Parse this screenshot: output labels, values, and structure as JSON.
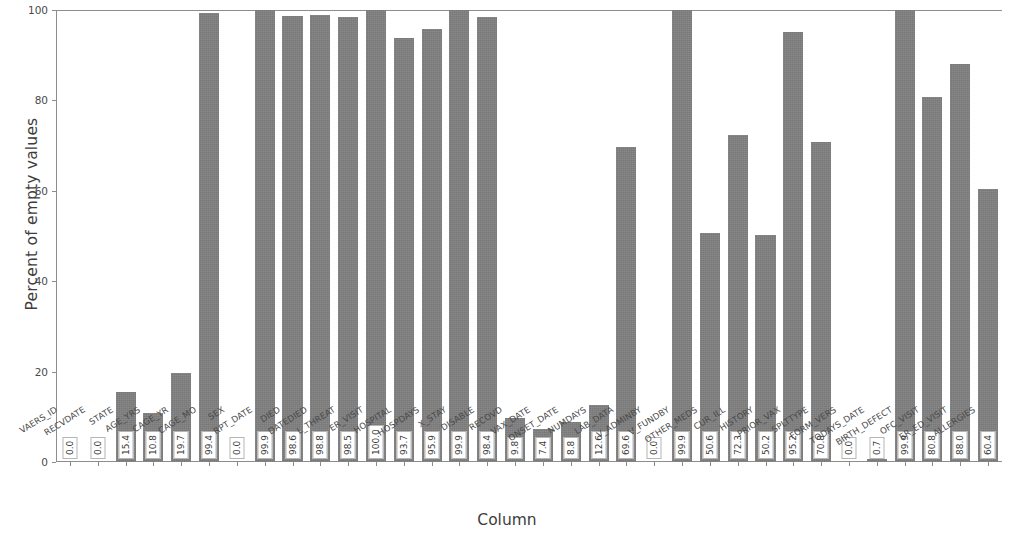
{
  "chart_data": {
    "type": "bar",
    "title": "",
    "xlabel": "Column",
    "ylabel": "Percent of empty values",
    "ylim": [
      0,
      100
    ],
    "yticks": [
      0,
      20,
      40,
      60,
      80,
      100
    ],
    "grid": false,
    "legend": "none",
    "bar_color": "#808080",
    "label_format": "one-decimal, rotated 90 degrees, white box inside bar base",
    "categories": [
      "VAERS_ID",
      "RECVDATE",
      "STATE",
      "AGE_YRS",
      "CAGE_YR",
      "CAGE_MO",
      "SEX",
      "RPT_DATE",
      "DIED",
      "DATEDIED",
      "L_THREAT",
      "ER_VISIT",
      "HOSPITAL",
      "HOSPDAYS",
      "X_STAY",
      "DISABLE",
      "RECOVD",
      "VAX_DATE",
      "ONSET_DATE",
      "NUMDAYS",
      "LAB_DATA",
      "V_ADMINBY",
      "V_FUNDBY",
      "OTHER_MEDS",
      "CUR_ILL",
      "HISTORY",
      "PRIOR_VAX",
      "SPLTTYPE",
      "FORM_VERS",
      "TODAYS_DATE",
      "BIRTH_DEFECT",
      "OFC_VISIT",
      "ER_ED_VISIT",
      "ALLERGIES"
    ],
    "values": [
      0.0,
      0.0,
      15.4,
      10.8,
      19.7,
      99.4,
      0.0,
      99.9,
      98.6,
      98.8,
      98.5,
      100.0,
      93.7,
      95.9,
      99.9,
      98.4,
      9.8,
      7.4,
      8.8,
      12.6,
      69.6,
      0.0,
      99.9,
      50.6,
      72.3,
      50.2,
      95.2,
      70.8,
      0.0,
      0.7,
      99.9,
      80.8,
      88.0,
      60.4
    ],
    "value_labels": [
      "0.0",
      "0.0",
      "15.4",
      "10.8",
      "19.7",
      "99.4",
      "0.0",
      "99.9",
      "98.6",
      "98.8",
      "98.5",
      "100.0",
      "93.7",
      "95.9",
      "99.9",
      "98.4",
      "9.8",
      "7.4",
      "8.8",
      "12.6",
      "69.6",
      "0.0",
      "99.9",
      "50.6",
      "72.3",
      "50.2",
      "95.2",
      "70.8",
      "0.0",
      "0.7",
      "99.9",
      "80.8",
      "88.0",
      "60.4"
    ]
  }
}
